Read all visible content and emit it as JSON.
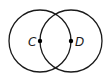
{
  "diagram": {
    "points": [
      {
        "id": "C",
        "label": "C"
      },
      {
        "id": "D",
        "label": "D"
      }
    ],
    "circles": [
      {
        "id": "circle-C",
        "center": "C",
        "passes_through": "D"
      },
      {
        "id": "circle-D",
        "center": "D",
        "passes_through": "C"
      }
    ],
    "colors": {
      "stroke": "#1a1a1a",
      "point": "#000000",
      "background": "#ffffff"
    }
  }
}
